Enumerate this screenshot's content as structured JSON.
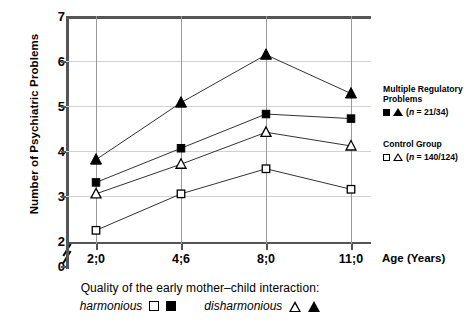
{
  "chart_data": {
    "type": "line",
    "title": "",
    "xlabel": "Age (Years)",
    "ylabel": "Number of Psychiatric Problems",
    "categories": [
      "2;0",
      "4;6",
      "8;0",
      "11;0"
    ],
    "ylim": [
      2,
      7
    ],
    "yticks": [
      "0",
      "2",
      "3",
      "4",
      "5",
      "6",
      "7"
    ],
    "y_axis_break": true,
    "grid": "horizontal-and-vertical",
    "legend_position": "right",
    "series": [
      {
        "name": "Multiple Regulatory Problems – disharmonious",
        "marker": "filled-triangle",
        "values": [
          3.85,
          5.1,
          6.15,
          5.3
        ]
      },
      {
        "name": "Multiple Regulatory Problems – harmonious",
        "marker": "filled-square",
        "values": [
          3.35,
          4.1,
          4.85,
          4.75
        ]
      },
      {
        "name": "Control Group – disharmonious",
        "marker": "open-triangle",
        "values": [
          3.1,
          3.75,
          4.45,
          4.15
        ]
      },
      {
        "name": "Control Group – harmonious",
        "marker": "open-square",
        "values": [
          2.3,
          3.1,
          3.65,
          3.2
        ]
      }
    ]
  },
  "axes": {
    "y_title": "Number of Psychiatric Problems",
    "x_title": "Age (Years)",
    "y_ticks": [
      "7",
      "6",
      "5",
      "4",
      "3",
      "2",
      "0"
    ],
    "x_ticks": [
      "2;0",
      "4;6",
      "8;0",
      "11;0"
    ]
  },
  "legend": {
    "group1": {
      "title_line1": "Multiple Regulatory",
      "title_line2": "Problems",
      "n_text": "(n = 21/34)",
      "n_italic": "n",
      "n_rest": " = 21/34)",
      "n_open": "(",
      "markers": [
        "filled-square",
        "filled-triangle"
      ]
    },
    "group2": {
      "title_line1": "Control Group",
      "n_open": "(",
      "n_italic": "n",
      "n_rest": " = 140/124)",
      "markers": [
        "open-square",
        "open-triangle"
      ]
    }
  },
  "caption": {
    "line1": "Quality of the early mother–child interaction:",
    "harmonious_label": "harmonious",
    "disharmonious_label": "disharmonious"
  },
  "colors": {
    "ink": "#000000",
    "axis": "#555555",
    "gridline": "#d2d2d2",
    "vgridline": "#9a9a9a"
  }
}
